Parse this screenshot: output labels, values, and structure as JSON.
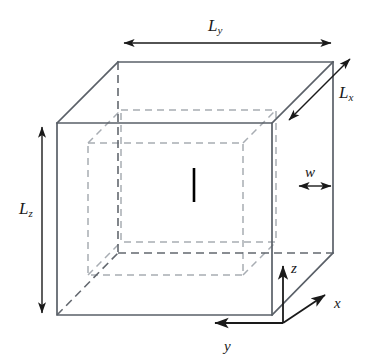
{
  "figure": {
    "background_color": "#ffffff",
    "outer_box_color": "#5a6068",
    "inner_box_color": "#a8adb3",
    "hidden_edge_color": "#63686f",
    "annotation_color": "#1a1a1a",
    "center_line_color": "#000000"
  },
  "labels": {
    "length_y": {
      "base": "L",
      "sub": "y",
      "name": "L_y"
    },
    "length_x": {
      "base": "L",
      "sub": "x",
      "name": "L_x"
    },
    "length_z": {
      "base": "L",
      "sub": "z",
      "name": "L_z"
    },
    "wall_thickness": "w",
    "axis_z": "z",
    "axis_x": "x",
    "axis_y": "y"
  },
  "geometry": {
    "outer_box": {
      "front_face": [
        [
          57,
          123
        ],
        [
          272,
          123
        ],
        [
          272,
          315
        ],
        [
          57,
          315
        ]
      ],
      "back_face": [
        [
          118,
          62
        ],
        [
          333,
          62
        ],
        [
          333,
          253
        ],
        [
          118,
          253
        ]
      ],
      "depth_offset": [
        61,
        -61
      ]
    },
    "inner_box": {
      "front_face": [
        [
          88,
          143
        ],
        [
          243,
          143
        ],
        [
          243,
          275
        ],
        [
          88,
          275
        ]
      ],
      "back_face": [
        [
          121,
          110
        ],
        [
          276,
          110
        ],
        [
          276,
          242
        ],
        [
          121,
          242
        ]
      ],
      "depth_offset": [
        33,
        -33
      ]
    },
    "center_line": {
      "x": 194,
      "y_top": 168,
      "y_bottom": 202
    },
    "axes_origin": [
      283,
      323
    ],
    "arrows": {
      "Ly": {
        "from": [
          122,
          43
        ],
        "to": [
          333,
          43
        ]
      },
      "Lx": {
        "from": [
          287,
          122
        ],
        "to": [
          352,
          57
        ]
      },
      "Lz": {
        "from": [
          42,
          125
        ],
        "to": [
          42,
          315
        ]
      },
      "w": {
        "from": [
          297,
          186
        ],
        "to": [
          333,
          186
        ]
      },
      "z": {
        "from": [
          283,
          323
        ],
        "to": [
          283,
          264
        ]
      },
      "x": {
        "from": [
          283,
          323
        ],
        "to": [
          327,
          294
        ]
      },
      "y": {
        "from": [
          283,
          323
        ],
        "to": [
          213,
          323
        ]
      }
    }
  }
}
